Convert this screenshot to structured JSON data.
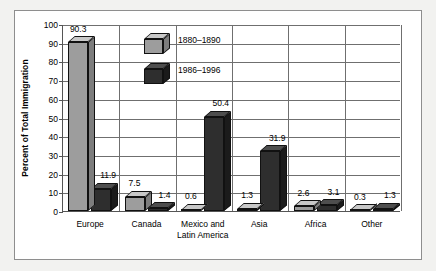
{
  "chart_data": {
    "type": "bar",
    "title": "",
    "xlabel": "",
    "ylabel": "Percent of Total Immigration",
    "ylim": [
      0,
      100
    ],
    "ytick_step": 10,
    "yticks": [
      "0",
      "10",
      "20",
      "30",
      "40",
      "50",
      "60",
      "70",
      "80",
      "90",
      "100"
    ],
    "grid": true,
    "legend_position": "inside-top-left",
    "categories": [
      "Europe",
      "Canada",
      "Mexico and Latin America",
      "Asia",
      "Africa",
      "Other"
    ],
    "category_lines": [
      [
        "Europe"
      ],
      [
        "Canada"
      ],
      [
        "Mexico and",
        "Latin America"
      ],
      [
        "Asia"
      ],
      [
        "Africa"
      ],
      [
        "Other"
      ]
    ],
    "series": [
      {
        "name": "1880–1890",
        "color": "#9d9d9d",
        "values": [
          90.3,
          7.5,
          0.6,
          1.3,
          2.6,
          0.3
        ],
        "labels": [
          "90.3",
          "7.5",
          "0.6",
          "1.3",
          "2.6",
          "0.3"
        ]
      },
      {
        "name": "1986–1996",
        "color": "#2e2e2e",
        "values": [
          11.9,
          1.4,
          50.4,
          31.9,
          3.1,
          1.3
        ],
        "labels": [
          "11.9",
          "1.4",
          "50.4",
          "31.9",
          "3.1",
          "1.3"
        ]
      }
    ]
  },
  "legend": {
    "items": [
      {
        "label": "1880–1890",
        "swatch": "light-gray-cube-icon"
      },
      {
        "label": "1986–1996",
        "swatch": "dark-gray-cube-icon"
      }
    ]
  },
  "colors": {
    "page_background": "#f2f2f0",
    "plot_background": "#ffffff",
    "frame_border": "#8e8e8e",
    "axis": "#555555",
    "gridline": "#6f6f6f",
    "series_light": "#9d9d9d",
    "series_dark": "#2e2e2e",
    "text": "#000000"
  }
}
